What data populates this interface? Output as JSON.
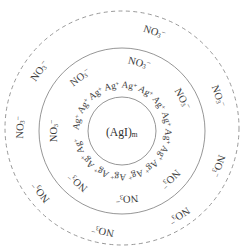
{
  "figure": {
    "background_color": "#ffffff",
    "stroke_color": "#8a8a8a",
    "text_color": "#3a3a3a"
  },
  "core": {
    "name": "colloid-core",
    "formula_base": "(AgI)",
    "formula_subscript": "m",
    "center_x": 122,
    "center_y": 131,
    "radius": 34
  },
  "stern_layer": {
    "name": "stern-layer",
    "center_x": 122,
    "center_y": 131,
    "radius": 83,
    "line_style": "solid",
    "counter_ion": {
      "base": "NO",
      "subscript": "3",
      "superscript": "−"
    },
    "counter_ion_labels": [
      {
        "angle_deg": -76,
        "radius": 72,
        "rotation": 14
      },
      {
        "angle_deg": -128,
        "radius": 70,
        "rotation": -38
      },
      {
        "angle_deg": -180,
        "radius": 70,
        "rotation": -90
      },
      {
        "angle_deg": 131,
        "radius": 70,
        "rotation": 221
      },
      {
        "angle_deg": 86,
        "radius": 70,
        "rotation": 176
      },
      {
        "angle_deg": 45,
        "radius": 70,
        "rotation": 135
      },
      {
        "angle_deg": -28,
        "radius": 70,
        "rotation": 62
      }
    ]
  },
  "adsorbed_ions": {
    "name": "adsorbed-ion-ring",
    "ion": {
      "base": "Ag",
      "superscript": "+"
    },
    "ring_radius": 48,
    "count": 16,
    "labels": [
      {
        "angle_deg": -103,
        "rotation": -13
      },
      {
        "angle_deg": -81,
        "rotation": 9
      },
      {
        "angle_deg": -59,
        "rotation": 31
      },
      {
        "angle_deg": -125,
        "rotation": -35
      },
      {
        "angle_deg": -147,
        "rotation": -57
      },
      {
        "angle_deg": -169,
        "rotation": -79
      },
      {
        "angle_deg": -37,
        "rotation": 53
      },
      {
        "angle_deg": -15,
        "rotation": 75
      },
      {
        "angle_deg": 7,
        "rotation": 97
      },
      {
        "angle_deg": 29,
        "rotation": 119
      },
      {
        "angle_deg": 51,
        "rotation": 141
      },
      {
        "angle_deg": 73,
        "rotation": 163
      },
      {
        "angle_deg": 95,
        "rotation": 185
      },
      {
        "angle_deg": 117,
        "rotation": 207
      },
      {
        "angle_deg": 139,
        "rotation": 229
      },
      {
        "angle_deg": 161,
        "rotation": 251
      }
    ]
  },
  "diffuse_layer": {
    "name": "diffuse-layer",
    "center_x": 122,
    "center_y": 128,
    "radius": 117,
    "line_style": "dashed",
    "counter_ion": {
      "base": "NO",
      "subscript": "3",
      "superscript": "−"
    },
    "counter_ion_labels": [
      {
        "angle_deg": -72,
        "radius": 106,
        "rotation": 18
      },
      {
        "angle_deg": -144,
        "radius": 104,
        "rotation": -54
      },
      {
        "angle_deg": -178,
        "radius": 104,
        "rotation": -88
      },
      {
        "angle_deg": 143,
        "radius": 104,
        "rotation": 233
      },
      {
        "angle_deg": 101,
        "radius": 104,
        "rotation": 191
      },
      {
        "angle_deg": 56,
        "radius": 104,
        "rotation": 146
      },
      {
        "angle_deg": 20,
        "radius": 104,
        "rotation": 110
      },
      {
        "angle_deg": -20,
        "radius": 104,
        "rotation": 70
      }
    ]
  }
}
